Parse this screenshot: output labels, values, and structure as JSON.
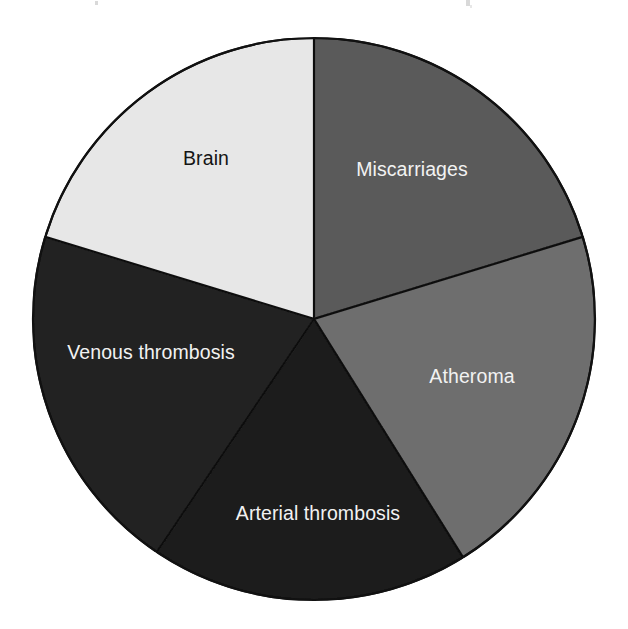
{
  "figure": {
    "background_color": "#ffffff",
    "width": 628,
    "height": 629
  },
  "chart_data": {
    "type": "pie",
    "title": "",
    "subtitle": "",
    "xlabel": "",
    "ylabel": "",
    "legend_position": "none",
    "grid": false,
    "labels_inside_slices": true,
    "start_angle_deg": 0,
    "direction": "clockwise",
    "center": {
      "x": 314,
      "y": 319
    },
    "radius": 281,
    "categories": [
      "Miscarriages",
      "Atheroma",
      "Arterial thrombosis",
      "Venous thrombosis",
      "Brain"
    ],
    "values": [
      73,
      75,
      66,
      73,
      73
    ],
    "units": "degrees",
    "percentages": [
      20.3,
      20.8,
      18.3,
      20.3,
      20.3
    ],
    "slices": [
      {
        "label": "Miscarriages",
        "start_angle": 0,
        "end_angle": 73,
        "sweep": 73,
        "percent": 20.3,
        "fill": "#5a5a5a",
        "text_color": "#f2f2f2",
        "label_x": 412,
        "label_y": 169
      },
      {
        "label": "Atheroma",
        "start_angle": 73,
        "end_angle": 148,
        "sweep": 75,
        "percent": 20.8,
        "fill": "#6e6e6e",
        "text_color": "#f2f2f2",
        "label_x": 472,
        "label_y": 376
      },
      {
        "label": "Arterial thrombosis",
        "start_angle": 148,
        "end_angle": 214,
        "sweep": 66,
        "percent": 18.3,
        "fill": "#1c1c1c",
        "text_color": "#f2f2f2",
        "label_x": 318,
        "label_y": 513
      },
      {
        "label": "Venous thrombosis",
        "start_angle": 214,
        "end_angle": 287,
        "sweep": 73,
        "percent": 20.3,
        "fill": "#232323",
        "text_color": "#f2f2f2",
        "label_x": 151,
        "label_y": 352
      },
      {
        "label": "Brain",
        "start_angle": 287,
        "end_angle": 360,
        "sweep": 73,
        "percent": 20.3,
        "fill": "#e7e7e7",
        "text_color": "#141414",
        "label_x": 206,
        "label_y": 158
      }
    ],
    "outline_color": "#111111",
    "outline_width": 2.2,
    "divider_color": "#111111",
    "divider_width": 2.2
  }
}
